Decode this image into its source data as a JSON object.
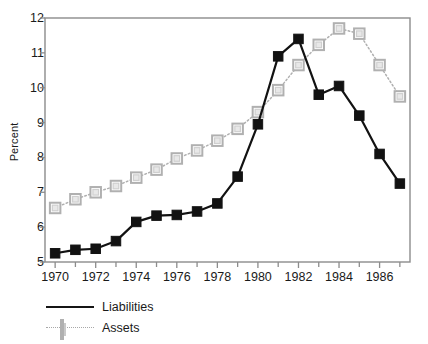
{
  "chart_data": {
    "type": "line",
    "title": "",
    "subtitle": "",
    "xlabel": "",
    "ylabel": "Percent",
    "x": [
      1970,
      1971,
      1972,
      1973,
      1974,
      1975,
      1976,
      1977,
      1978,
      1979,
      1980,
      1981,
      1982,
      1983,
      1984,
      1985,
      1986,
      1987
    ],
    "xlim": [
      1969.5,
      1987.5
    ],
    "ylim": [
      5,
      12
    ],
    "xticks": [
      1970,
      1972,
      1974,
      1976,
      1978,
      1980,
      1982,
      1984,
      1986
    ],
    "xtick_labels": [
      "1970",
      "1972",
      "1974",
      "1976",
      "1978",
      "1980",
      "1982",
      "1984",
      "1986"
    ],
    "xminor_ticks": [
      1971,
      1973,
      1975,
      1977,
      1979,
      1981,
      1983,
      1985,
      1987
    ],
    "yticks": [
      5,
      6,
      7,
      8,
      9,
      10,
      11,
      12
    ],
    "ytick_labels": [
      "5",
      "6",
      "7",
      "8",
      "9",
      "10",
      "11",
      "12"
    ],
    "grid": false,
    "legend_position": "below-left",
    "frame": true,
    "series": [
      {
        "name": "Liabilities",
        "color": "#121212",
        "line_style": "solid",
        "marker": "filled-square",
        "values": [
          5.25,
          5.35,
          5.38,
          5.6,
          6.15,
          6.33,
          6.35,
          6.45,
          6.68,
          7.45,
          8.95,
          10.9,
          11.4,
          9.8,
          10.05,
          9.2,
          8.1,
          7.25
        ]
      },
      {
        "name": "Assets",
        "color": "#b0b0b0",
        "line_style": "dotted",
        "marker": "open-square",
        "values": [
          6.55,
          6.8,
          7.0,
          7.18,
          7.42,
          7.65,
          7.97,
          8.2,
          8.48,
          8.82,
          9.3,
          9.93,
          10.65,
          11.23,
          11.7,
          11.55,
          10.65,
          9.75
        ]
      }
    ]
  },
  "legend": {
    "items": [
      {
        "label": "Liabilities"
      },
      {
        "label": "Assets"
      }
    ]
  }
}
